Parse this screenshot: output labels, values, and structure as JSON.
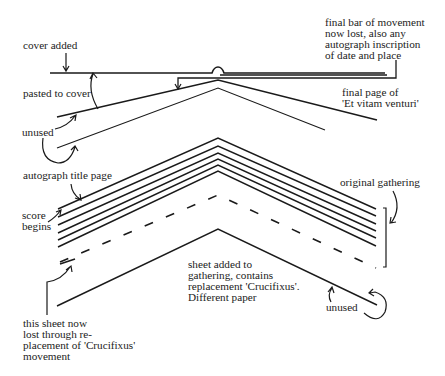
{
  "labels": {
    "cover_added": "cover added",
    "final_bar": "final bar of movement\nnow lost, also any\nautograph inscription\nof date and place",
    "pasted_to_cover": "pasted to cover",
    "final_page": "final page of\n'Et vitam venturi'",
    "unused_top": "unused",
    "autograph_title_page": "autograph title page",
    "score_begins": "score\nbegins",
    "original_gathering": "original gathering",
    "sheet_added": "sheet added to\ngathering, contains\nreplacement 'Crucifixus'.\nDifferent paper",
    "unused_bottom": "unused",
    "sheet_lost": "this sheet now\nlost through re-\nplacement of 'Crucifixus'\nmovement"
  },
  "colors": {
    "ink": "#1a1a1a",
    "background": "#ffffff"
  }
}
